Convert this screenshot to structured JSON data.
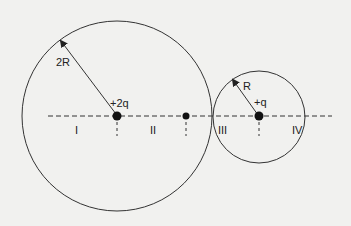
{
  "diagram": {
    "axis": {
      "style": "dashed",
      "x_start": 48,
      "x_end": 332,
      "y": 116
    },
    "charges": [
      {
        "label": "+2q",
        "x": 117,
        "y": 116
      },
      {
        "label": "",
        "x": 186,
        "y": 116
      },
      {
        "label": "+q",
        "x": 259,
        "y": 116
      }
    ],
    "circles": [
      {
        "cx": 117,
        "cy": 116,
        "r": 95,
        "radius_label": "2R"
      },
      {
        "cx": 259,
        "cy": 117,
        "r": 46,
        "radius_label": "R"
      }
    ],
    "regions": [
      {
        "label": "I",
        "x": 75,
        "y": 125
      },
      {
        "label": "II",
        "x": 150,
        "y": 125
      },
      {
        "label": "III",
        "x": 218,
        "y": 125
      },
      {
        "label": "IV",
        "x": 292,
        "y": 125
      }
    ],
    "radius_labels": {
      "big": "2R",
      "small": "R"
    },
    "charge_labels": {
      "big": "+2q",
      "small": "+q"
    },
    "colors": {
      "line": "#222222",
      "background": "#f1f1ef"
    }
  }
}
